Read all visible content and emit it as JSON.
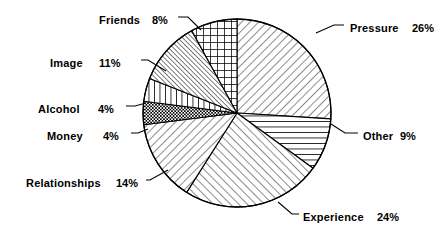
{
  "chart_data": {
    "type": "pie",
    "title": "",
    "subtitle": "",
    "xlabel": "",
    "ylabel": "",
    "legend_position": "callout-labels",
    "grid": false,
    "total": 100,
    "units": "%",
    "start_angle_deg": 0,
    "direction": "clockwise",
    "categories": [
      "Pressure",
      "Other",
      "Experience",
      "Relationships",
      "Money",
      "Alcohol",
      "Image",
      "Friends"
    ],
    "values": [
      26,
      9,
      24,
      14,
      4,
      4,
      11,
      8
    ],
    "slices": [
      {
        "label": "Pressure",
        "value": 26,
        "value_text": "26%",
        "pattern": "diagonal-forward-hatch",
        "start_deg": 0,
        "end_deg": 93.6,
        "label_x": 350,
        "label_y": 29,
        "pct_x": 412,
        "pct_y": 29,
        "anchor": "start",
        "leader": "M 316 33 L 334 25 L 344 25"
      },
      {
        "label": "Other",
        "value": 9,
        "value_text": "9%",
        "pattern": "horizontal-lines",
        "start_deg": 93.6,
        "end_deg": 126,
        "label_x": 363,
        "label_y": 137,
        "pct_x": 400,
        "pct_y": 137,
        "anchor": "start",
        "leader": "M 331 124 L 345 133 L 358 133"
      },
      {
        "label": "Experience",
        "value": 24,
        "value_text": "24%",
        "pattern": "diagonal-back-hatch",
        "start_deg": 126,
        "end_deg": 212.4,
        "label_x": 303,
        "label_y": 218,
        "pct_x": 377,
        "pct_y": 218,
        "anchor": "start",
        "leader": "M 278 202 L 292 214 L 299 214"
      },
      {
        "label": "Relationships",
        "value": 14,
        "value_text": "14%",
        "pattern": "diagonal-forward-hatch",
        "start_deg": 212.4,
        "end_deg": 262.8,
        "label_x": 26,
        "label_y": 184,
        "pct_x": 116,
        "pct_y": 184,
        "anchor": "start",
        "leader": "M 168 170 L 150 180 L 146 180"
      },
      {
        "label": "Money",
        "value": 4,
        "value_text": "4%",
        "pattern": "fine-checker",
        "start_deg": 262.8,
        "end_deg": 277.2,
        "label_x": 47,
        "label_y": 137,
        "pct_x": 103,
        "pct_y": 137,
        "anchor": "start",
        "leader": "M 148 129 L 138 133 L 131 133"
      },
      {
        "label": "Alcohol",
        "value": 4,
        "value_text": "4%",
        "pattern": "vertical-lines",
        "start_deg": 277.2,
        "end_deg": 291.6,
        "label_x": 38,
        "label_y": 110,
        "pct_x": 98,
        "pct_y": 110,
        "anchor": "start",
        "leader": "M 146 103 L 135 106 L 126 106"
      },
      {
        "label": "Image",
        "value": 11,
        "value_text": "11%",
        "pattern": "dense-diagonal-back",
        "start_deg": 291.6,
        "end_deg": 331.2,
        "label_x": 50,
        "label_y": 64,
        "pct_x": 99,
        "pct_y": 64,
        "anchor": "start",
        "leader": "M 166 71 L 148 60 L 141 60"
      },
      {
        "label": "Friends",
        "value": 8,
        "value_text": "8%",
        "pattern": "grid-crosshatch",
        "start_deg": 331.2,
        "end_deg": 360,
        "label_x": 99,
        "label_y": 21,
        "pct_x": 152,
        "pct_y": 21,
        "anchor": "start",
        "leader": "M 201 30 L 188 17 L 178 17"
      }
    ],
    "geometry": {
      "center_x": 237,
      "center_y": 113,
      "radius": 94
    }
  }
}
